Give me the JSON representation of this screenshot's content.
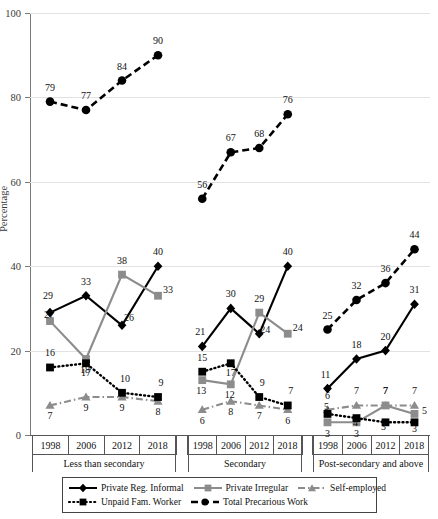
{
  "chart_data": {
    "type": "line",
    "title": "",
    "xlabel": "",
    "ylabel": "Percentage",
    "ylim": [
      0,
      100
    ],
    "yticks": [
      0,
      20,
      40,
      60,
      80,
      100
    ],
    "grid": true,
    "legend_position": "bottom",
    "categories": [
      "1998",
      "2006",
      "2012",
      "2018"
    ],
    "groups": [
      {
        "label": "Less than secondary",
        "years": [
          "1998",
          "2006",
          "2012",
          "2018"
        ]
      },
      {
        "label": "Secondary",
        "years": [
          "1998",
          "2006",
          "2012",
          "2018"
        ]
      },
      {
        "label": "Post-secondary and above",
        "years": [
          "1998",
          "2006",
          "2012",
          "2018"
        ]
      }
    ],
    "series": [
      {
        "name": "Private Reg. Informal",
        "color": "#000000",
        "marker": "diamond",
        "dash": "solid",
        "values_by_group": [
          [
            29,
            33,
            26,
            40
          ],
          [
            21,
            30,
            24,
            40
          ],
          [
            11,
            18,
            20,
            31
          ]
        ]
      },
      {
        "name": "Private Irregular",
        "color": "#8c8c8c",
        "marker": "square",
        "dash": "solid",
        "values_by_group": [
          [
            27,
            18,
            38,
            33
          ],
          [
            13,
            12,
            29,
            24
          ],
          [
            3,
            3,
            7,
            5
          ]
        ]
      },
      {
        "name": "Self-employed",
        "color": "#8c8c8c",
        "marker": "triangle",
        "dash": "dashdot",
        "values_by_group": [
          [
            7,
            9,
            9,
            8
          ],
          [
            6,
            8,
            7,
            6
          ],
          [
            6,
            7,
            7,
            7
          ]
        ]
      },
      {
        "name": "Unpaid Fam. Worker",
        "color": "#000000",
        "marker": "square",
        "dash": "dotted",
        "values_by_group": [
          [
            16,
            17,
            10,
            9
          ],
          [
            15,
            17,
            9,
            7
          ],
          [
            5,
            4,
            3,
            3
          ]
        ]
      },
      {
        "name": "Total Precarious Work",
        "color": "#000000",
        "marker": "circle",
        "dash": "dashed",
        "values_by_group": [
          [
            79,
            77,
            84,
            90
          ],
          [
            56,
            67,
            68,
            76
          ],
          [
            25,
            32,
            36,
            44
          ]
        ]
      }
    ]
  },
  "axis": {
    "y_title": "Percentage",
    "y_ticks": [
      "0",
      "20",
      "40",
      "60",
      "80",
      "100"
    ]
  },
  "legend": {
    "items": [
      {
        "label": "Private Reg. Informal",
        "icon": "line-diamond-solid-black"
      },
      {
        "label": "Private Irregular",
        "icon": "line-square-solid-gray"
      },
      {
        "label": "Self-employed",
        "icon": "line-triangle-dashdot-gray"
      },
      {
        "label": "Unpaid Fam. Worker",
        "icon": "line-square-dotted-black"
      },
      {
        "label": "Total Precarious Work",
        "icon": "line-circle-dashed-black"
      }
    ]
  }
}
